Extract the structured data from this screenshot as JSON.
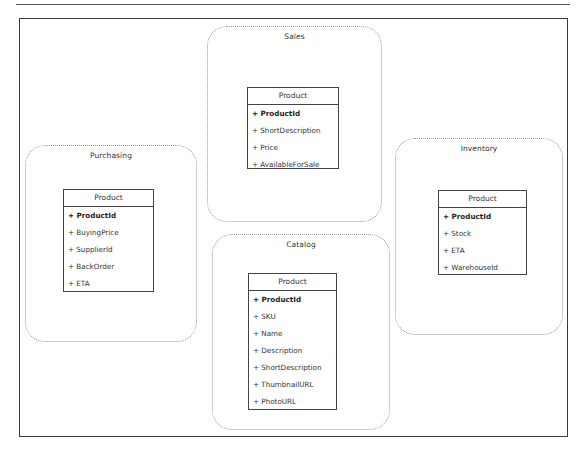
{
  "diagram": {
    "type": "bounded-context-map",
    "contexts": [
      {
        "name": "Sales",
        "class": {
          "title": "Product",
          "attributes": [
            {
              "text": "+ ProductId",
              "key": true
            },
            {
              "text": "+ ShortDescription",
              "key": false
            },
            {
              "text": "+ Price",
              "key": false
            },
            {
              "text": "+ AvailableForSale",
              "key": false
            }
          ]
        }
      },
      {
        "name": "Purchasing",
        "class": {
          "title": "Product",
          "attributes": [
            {
              "text": "+ ProductId",
              "key": true
            },
            {
              "text": "+ BuyingPrice",
              "key": false
            },
            {
              "text": "+ SupplierId",
              "key": false
            },
            {
              "text": "+ BackOrder",
              "key": false
            },
            {
              "text": "+ ETA",
              "key": false
            }
          ]
        }
      },
      {
        "name": "Catalog",
        "class": {
          "title": "Product",
          "attributes": [
            {
              "text": "+ ProductId",
              "key": true
            },
            {
              "text": "+ SKU",
              "key": false
            },
            {
              "text": "+ Name",
              "key": false
            },
            {
              "text": "+ Description",
              "key": false
            },
            {
              "text": "+ ShortDescription",
              "key": false
            },
            {
              "text": "+ ThumbnailURL",
              "key": false
            },
            {
              "text": "+ PhotoURL",
              "key": false
            }
          ]
        }
      },
      {
        "name": "Inventory",
        "class": {
          "title": "Product",
          "attributes": [
            {
              "text": "+ ProductId",
              "key": true
            },
            {
              "text": "+ Stock",
              "key": false
            },
            {
              "text": "+ ETA",
              "key": false
            },
            {
              "text": "+ WarehouseId",
              "key": false
            }
          ]
        }
      }
    ]
  },
  "colors": {
    "frame": "#3a3a3a",
    "context_border": "#9a9a9a",
    "class_border": "#444444",
    "text": "#333333"
  }
}
